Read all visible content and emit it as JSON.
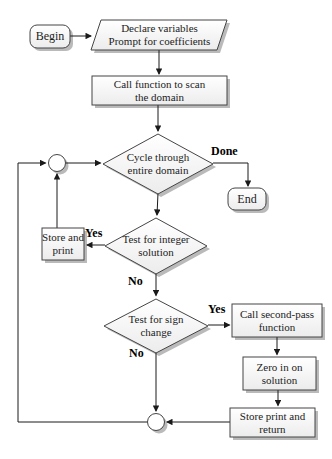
{
  "figure": {
    "type": "flowchart",
    "nodes": {
      "begin": {
        "label": "Begin",
        "shape": "rounded-terminal"
      },
      "declare": {
        "label": "Declare variables\nPrompt for coefficients",
        "shape": "parallelogram-io"
      },
      "call_scan": {
        "label": "Call function to scan\nthe domain",
        "shape": "process-rect"
      },
      "cycle": {
        "label": "Cycle through\nentire domain",
        "shape": "decision-diamond"
      },
      "end": {
        "label": "End",
        "shape": "rounded-terminal"
      },
      "store_print": {
        "label": "Store and\nprint",
        "shape": "process-rect"
      },
      "test_integer": {
        "label": "Test for integer\nsolution",
        "shape": "decision-diamond"
      },
      "test_sign": {
        "label": "Test for sign\nchange",
        "shape": "decision-diamond"
      },
      "call_second": {
        "label": "Call second-pass\nfunction",
        "shape": "process-rect"
      },
      "zero_in": {
        "label": "Zero in on\nsolution",
        "shape": "process-rect"
      },
      "store_return": {
        "label": "Store print and\nreturn",
        "shape": "process-rect"
      },
      "junction_top": {
        "label": "",
        "shape": "connector-circle"
      },
      "junction_bottom": {
        "label": "",
        "shape": "connector-circle"
      }
    },
    "edge_labels": {
      "done": "Done",
      "yes_integer": "Yes",
      "no_integer": "No",
      "yes_sign": "Yes",
      "no_sign": "No"
    },
    "colors": {
      "background": "#ffffff",
      "shape_fill_top": "#ffffff",
      "shape_fill_bottom": "#ececec",
      "shape_border": "#454545",
      "shadow": "#aeaeae",
      "connector": "#1a1a1a",
      "text": "#1c1c1c"
    }
  }
}
